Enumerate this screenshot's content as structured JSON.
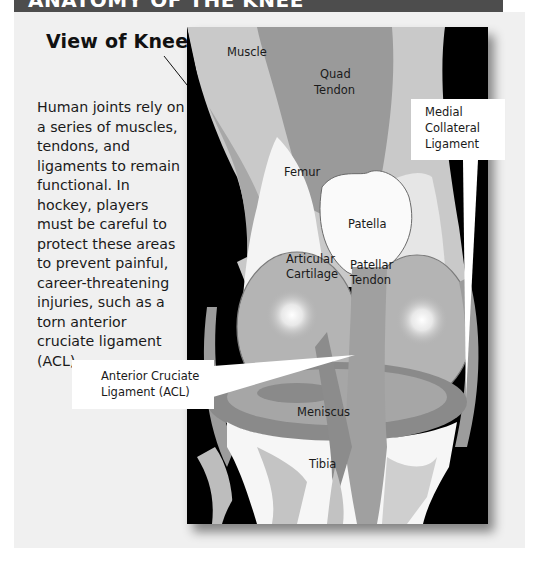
{
  "header": {
    "title": "ANATOMY OF THE KNEE",
    "background_color": "#4d4d4d"
  },
  "view_title": "View of Knee",
  "body_text": "Human joints rely on a series of muscles, tendons, and ligaments to remain functional. In hockey, players must be careful to protect these areas to prevent painful, career-threatening injuries, such as a torn anterior cruciate ligament (ACL).",
  "diagram": {
    "background_color": "#000000",
    "labels": {
      "muscle": "Muscle",
      "quad_tendon_1": "Quad",
      "quad_tendon_2": "Tendon",
      "femur": "Femur",
      "patella": "Patella",
      "articular_cartilage_1": "Articular",
      "articular_cartilage_2": "Cartilage",
      "patellar_tendon_1": "Patellar",
      "patellar_tendon_2": "Tendon",
      "meniscus": "Meniscus",
      "tibia": "Tibia"
    },
    "callouts": {
      "mcl_1": "Medial",
      "mcl_2": "Collateral",
      "mcl_3": "Ligament",
      "acl_1": "Anterior Cruciate",
      "acl_2": "Ligament (ACL)"
    }
  }
}
